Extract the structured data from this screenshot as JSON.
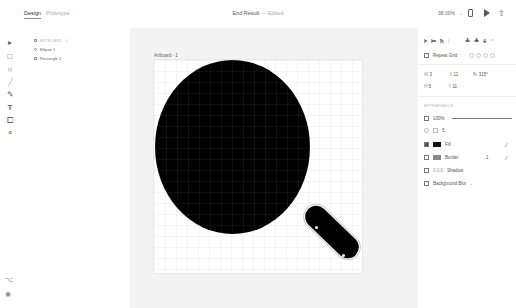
{
  "topbar": {
    "tabs": [
      {
        "label": "Design",
        "active": true
      },
      {
        "label": "Prototype",
        "active": false
      }
    ],
    "title": "End Result",
    "title_separator": " — ",
    "title_status": "Edited",
    "zoom": "38.00%",
    "icons": {
      "device": "device-preview-icon",
      "play": "play-icon",
      "share": "share-icon"
    }
  },
  "toolbar": {
    "tools": [
      {
        "name": "select",
        "glyph": "▸"
      },
      {
        "name": "rectangle",
        "glyph": "□"
      },
      {
        "name": "ellipse",
        "glyph": "○"
      },
      {
        "name": "line",
        "glyph": "╱"
      },
      {
        "name": "pen",
        "glyph": "✎"
      },
      {
        "name": "text",
        "glyph": "T"
      },
      {
        "name": "artboard",
        "glyph": "⧠"
      },
      {
        "name": "zoom",
        "glyph": "⌕"
      }
    ],
    "bottom": [
      {
        "name": "plugins",
        "glyph": "⌥"
      },
      {
        "name": "assets",
        "glyph": "◉"
      }
    ]
  },
  "layers": {
    "header": "ARTBOARD - 1",
    "items": [
      {
        "label": "Ellipse 1"
      },
      {
        "label": "Rectangle 1"
      }
    ]
  },
  "canvas": {
    "artboard_label": "Artboard - 1",
    "background": "#f3f3f3",
    "shapes": [
      {
        "type": "ellipse",
        "fill": "#000000"
      },
      {
        "type": "rounded-rectangle",
        "fill": "#000000",
        "rotation": "44°"
      }
    ]
  },
  "panel": {
    "align_icons": [
      "align-left",
      "align-center",
      "align-right",
      "distribute",
      "align-top",
      "align-middle",
      "align-bottom",
      "distribute-v"
    ],
    "repeat_grid": "Repeat Grid",
    "transform": {
      "w": "3",
      "h": "5",
      "x": "11",
      "y": "11",
      "rotation": "315°"
    },
    "appearance_header": "APPEARANCE",
    "opacity": "100%",
    "corner_radius": "5",
    "fill": {
      "label": "Fill",
      "checked": true,
      "color": "#111111"
    },
    "border": {
      "label": "Border",
      "checked": false,
      "color": "#888888",
      "width": "1"
    },
    "shadow": {
      "label": "Shadow",
      "checked": false,
      "values": "0,0,0"
    },
    "background_blur": {
      "label": "Background Blur",
      "checked": false
    }
  }
}
